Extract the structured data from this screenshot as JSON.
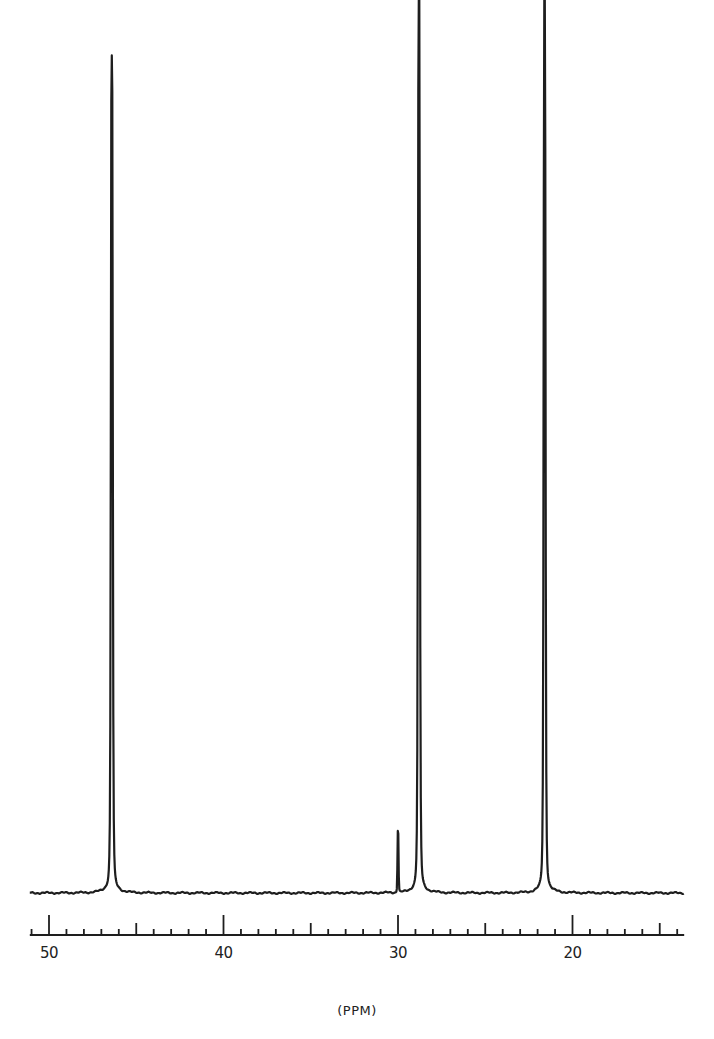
{
  "chart_data": {
    "type": "line",
    "title": "",
    "xlabel": "(PPM)",
    "ylabel": "",
    "x_reversed": true,
    "xlim": [
      51.1,
      13.6
    ],
    "x_ticks_major": [
      50,
      40,
      30,
      20
    ],
    "x_tick_labels": [
      "50",
      "40",
      "30",
      "20"
    ],
    "x_tick_minor_step": 1,
    "grid": false,
    "legend": null,
    "peaks": [
      {
        "ppm": 46.4,
        "relative_height": 0.92,
        "label": ""
      },
      {
        "ppm": 30.0,
        "relative_height": 0.07,
        "label": ""
      },
      {
        "ppm": 28.8,
        "relative_height": 1.0,
        "label": ""
      },
      {
        "ppm": 21.6,
        "relative_height": 1.0,
        "label": ""
      }
    ],
    "series": [
      {
        "name": "13C NMR spectrum",
        "x": [
          51.1,
          46.8,
          46.5,
          46.4,
          46.3,
          46.0,
          30.1,
          30.0,
          29.9,
          29.1,
          28.9,
          28.8,
          28.7,
          28.4,
          21.9,
          21.7,
          21.6,
          21.5,
          21.2,
          13.6
        ],
        "y": [
          0.0,
          0.01,
          0.06,
          0.92,
          0.06,
          0.01,
          0.0,
          0.07,
          0.0,
          0.03,
          0.3,
          1.0,
          0.3,
          0.02,
          0.03,
          0.3,
          1.0,
          0.3,
          0.02,
          0.0
        ]
      }
    ]
  },
  "axis": {
    "label": "(PPM)",
    "ticks": [
      {
        "value": 50,
        "label": "50"
      },
      {
        "value": 40,
        "label": "40"
      },
      {
        "value": 30,
        "label": "30"
      },
      {
        "value": 20,
        "label": "20"
      }
    ]
  }
}
